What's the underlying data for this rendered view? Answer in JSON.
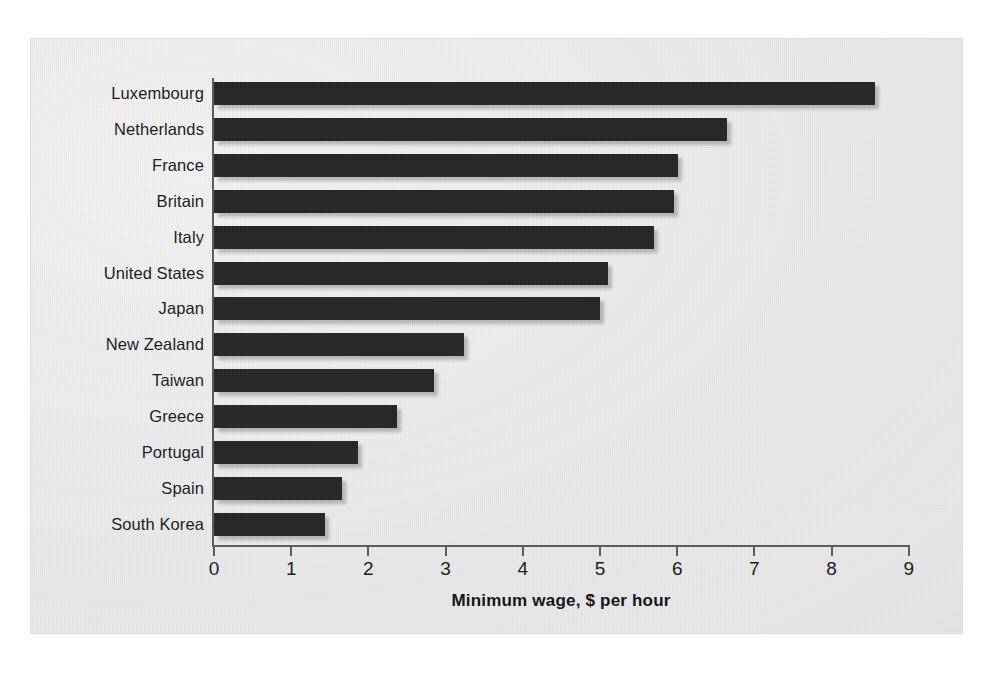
{
  "chart_data": {
    "type": "bar",
    "orientation": "horizontal",
    "title": "",
    "subtitle": "",
    "xlabel": "Minimum wage, $ per hour",
    "ylabel": "",
    "categories": [
      "Luxembourg",
      "Netherlands",
      "France",
      "Britain",
      "Italy",
      "United States",
      "Japan",
      "New Zealand",
      "Taiwan",
      "Greece",
      "Portugal",
      "Spain",
      "South Korea"
    ],
    "values": [
      8.56,
      6.65,
      6.01,
      5.96,
      5.7,
      5.1,
      5.0,
      3.24,
      2.85,
      2.37,
      1.86,
      1.66,
      1.44
    ],
    "xlim": [
      0,
      9
    ],
    "xticks": [
      0,
      1,
      2,
      3,
      4,
      5,
      6,
      7,
      8,
      9
    ],
    "xtick_labels": [
      "0",
      "1",
      "2",
      "3",
      "4",
      "5",
      "6",
      "7",
      "8",
      "9"
    ],
    "grid": false,
    "legend": null,
    "series": [
      {
        "name": "Minimum wage",
        "unit": "$ per hour",
        "values": [
          8.56,
          6.65,
          6.01,
          5.96,
          5.7,
          5.1,
          5.0,
          3.24,
          2.85,
          2.37,
          1.86,
          1.66,
          1.44
        ]
      }
    ],
    "colors": {
      "bar": "#262626",
      "axis": "#5b5b5d",
      "text": "#1b1b1b",
      "panel_background": "#ececed",
      "page_background": "#ffffff"
    }
  }
}
